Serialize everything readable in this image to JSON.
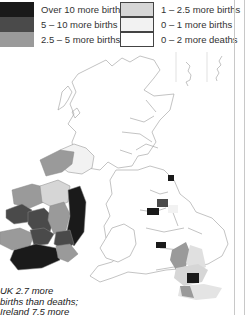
{
  "legend": {
    "items": [
      {
        "label": "Over 10 more births",
        "color": "#1a1a1a"
      },
      {
        "label": "5 – 10 more births",
        "color": "#4a4a4a"
      },
      {
        "label": "2.5 – 5 more births",
        "color": "#9a9a9a"
      },
      {
        "label": "1 – 2.5 more births",
        "color": "#d6d6d6"
      },
      {
        "label": "0 – 1 more births",
        "color": "#f2f2f2"
      },
      {
        "label": "0 – 2 more deaths",
        "color": "#ffffff"
      }
    ]
  },
  "map": {
    "regions": [
      "Ireland",
      "Northern Ireland",
      "Scotland",
      "England",
      "Wales",
      "Shetland",
      "Orkney"
    ]
  },
  "note": {
    "line1": "UK 2.7 more",
    "line2": "births than deaths;",
    "line3": "Ireland 7.5 more"
  }
}
